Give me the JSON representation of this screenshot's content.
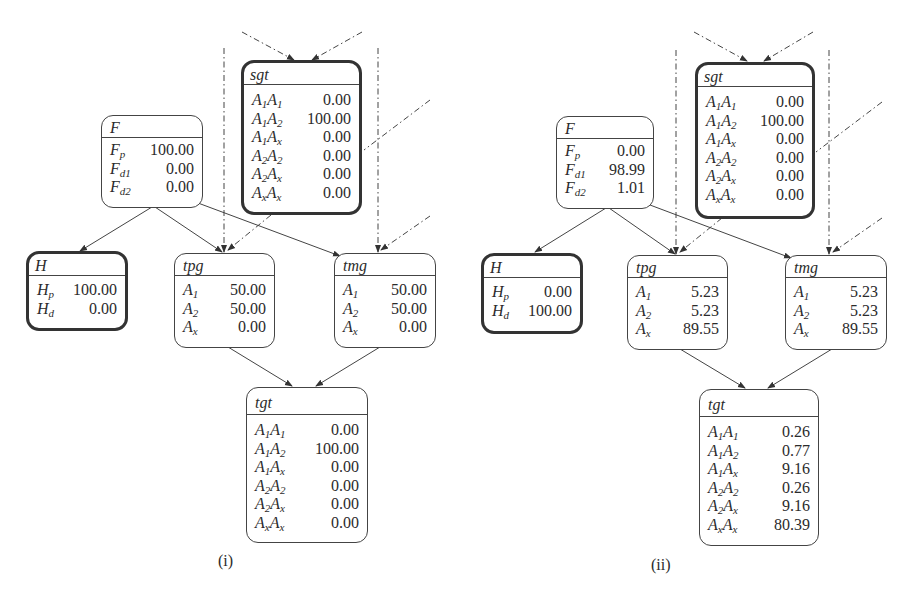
{
  "panels": [
    {
      "caption": "(i)",
      "nodes": {
        "F": {
          "title": "F",
          "rows": [
            {
              "base": "F",
              "sub": "p",
              "value": "100.00"
            },
            {
              "base": "F",
              "sub": "d1",
              "value": "0.00"
            },
            {
              "base": "F",
              "sub": "d2",
              "value": "0.00"
            }
          ]
        },
        "sgt": {
          "title": "sgt",
          "evidence": true,
          "rows": [
            {
              "label": "A1A1",
              "value": "0.00"
            },
            {
              "label": "A1A2",
              "value": "100.00"
            },
            {
              "label": "A1Ax",
              "value": "0.00"
            },
            {
              "label": "A2A2",
              "value": "0.00"
            },
            {
              "label": "A2Ax",
              "value": "0.00"
            },
            {
              "label": "AxAx",
              "value": "0.00"
            }
          ]
        },
        "H": {
          "title": "H",
          "evidence": true,
          "rows": [
            {
              "base": "H",
              "sub": "p",
              "value": "100.00"
            },
            {
              "base": "H",
              "sub": "d",
              "value": "0.00"
            }
          ]
        },
        "tpg": {
          "title": "tpg",
          "rows": [
            {
              "base": "A",
              "sub": "1",
              "value": "50.00"
            },
            {
              "base": "A",
              "sub": "2",
              "value": "50.00"
            },
            {
              "base": "A",
              "sub": "x",
              "value": "0.00"
            }
          ]
        },
        "tmg": {
          "title": "tmg",
          "rows": [
            {
              "base": "A",
              "sub": "1",
              "value": "50.00"
            },
            {
              "base": "A",
              "sub": "2",
              "value": "50.00"
            },
            {
              "base": "A",
              "sub": "x",
              "value": "0.00"
            }
          ]
        },
        "tgt": {
          "title": "tgt",
          "rows": [
            {
              "label": "A1A1",
              "value": "0.00"
            },
            {
              "label": "A1A2",
              "value": "100.00"
            },
            {
              "label": "A1Ax",
              "value": "0.00"
            },
            {
              "label": "A2A2",
              "value": "0.00"
            },
            {
              "label": "A2Ax",
              "value": "0.00"
            },
            {
              "label": "AxAx",
              "value": "0.00"
            }
          ]
        }
      }
    },
    {
      "caption": "(ii)",
      "nodes": {
        "F": {
          "title": "F",
          "rows": [
            {
              "base": "F",
              "sub": "p",
              "value": "0.00"
            },
            {
              "base": "F",
              "sub": "d1",
              "value": "98.99"
            },
            {
              "base": "F",
              "sub": "d2",
              "value": "1.01"
            }
          ]
        },
        "sgt": {
          "title": "sgt",
          "evidence": true,
          "rows": [
            {
              "label": "A1A1",
              "value": "0.00"
            },
            {
              "label": "A1A2",
              "value": "100.00"
            },
            {
              "label": "A1Ax",
              "value": "0.00"
            },
            {
              "label": "A2A2",
              "value": "0.00"
            },
            {
              "label": "A2Ax",
              "value": "0.00"
            },
            {
              "label": "AxAx",
              "value": "0.00"
            }
          ]
        },
        "H": {
          "title": "H",
          "evidence": true,
          "rows": [
            {
              "base": "H",
              "sub": "p",
              "value": "0.00"
            },
            {
              "base": "H",
              "sub": "d",
              "value": "100.00"
            }
          ]
        },
        "tpg": {
          "title": "tpg",
          "rows": [
            {
              "base": "A",
              "sub": "1",
              "value": "5.23"
            },
            {
              "base": "A",
              "sub": "2",
              "value": "5.23"
            },
            {
              "base": "A",
              "sub": "x",
              "value": "89.55"
            }
          ]
        },
        "tmg": {
          "title": "tmg",
          "rows": [
            {
              "base": "A",
              "sub": "1",
              "value": "5.23"
            },
            {
              "base": "A",
              "sub": "2",
              "value": "5.23"
            },
            {
              "base": "A",
              "sub": "x",
              "value": "89.55"
            }
          ]
        },
        "tgt": {
          "title": "tgt",
          "rows": [
            {
              "label": "A1A1",
              "value": "0.26"
            },
            {
              "label": "A1A2",
              "value": "0.77"
            },
            {
              "label": "A1Ax",
              "value": "9.16"
            },
            {
              "label": "A2A2",
              "value": "0.26"
            },
            {
              "label": "A2Ax",
              "value": "9.16"
            },
            {
              "label": "AxAx",
              "value": "80.39"
            }
          ]
        }
      }
    }
  ],
  "edges": [
    {
      "from": "F",
      "to": "H",
      "style": "solid"
    },
    {
      "from": "F",
      "to": "tpg",
      "style": "solid"
    },
    {
      "from": "F",
      "to": "tmg",
      "style": "solid"
    },
    {
      "from": "tpg",
      "to": "tgt",
      "style": "solid"
    },
    {
      "from": "tmg",
      "to": "tgt",
      "style": "solid"
    },
    {
      "from": "sgt",
      "to": "tpg",
      "style": "dash-dot"
    },
    {
      "from": "external",
      "to": "sgt",
      "style": "dash-dot",
      "count": 2
    },
    {
      "from": "external",
      "to": "tpg",
      "style": "dash-dot"
    },
    {
      "from": "external",
      "to": "tmg",
      "style": "dash-dot",
      "count": 2
    }
  ]
}
